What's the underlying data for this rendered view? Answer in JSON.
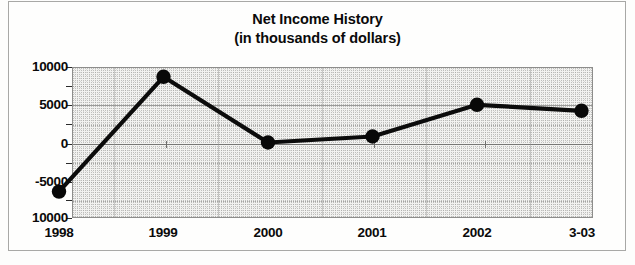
{
  "chart_data": {
    "type": "line",
    "title": "Net Income History",
    "subtitle": "(in thousands of dollars)",
    "xlabel": "",
    "ylabel": "",
    "categories": [
      "1998",
      "1999",
      "2000",
      "2001",
      "2002",
      "3-03"
    ],
    "values": [
      -6500,
      8700,
      0,
      800,
      5000,
      4200
    ],
    "series": [
      {
        "name": "Net Income",
        "values": [
          -6500,
          8700,
          0,
          800,
          5000,
          4200
        ]
      }
    ],
    "ylim": [
      -10000,
      10000
    ],
    "ytick_labels": [
      "10000",
      "5000",
      "0",
      "-5000",
      "10000"
    ],
    "ytick_values": [
      10000,
      5000,
      0,
      -5000,
      -10000
    ],
    "minor_tick_values": [
      7500,
      2500,
      -2500,
      -7500
    ],
    "grid": true,
    "legend": false,
    "legend_position": "none",
    "marker": "filled-circle",
    "line_color": "#0b0b0b",
    "plot_background": "#f2f2f0"
  },
  "title": {
    "line1": "Net Income History",
    "line2": "(in thousands of dollars)"
  },
  "axes": {
    "y": {
      "labels": [
        {
          "text": "10000",
          "value": 10000
        },
        {
          "text": "5000",
          "value": 5000
        },
        {
          "text": "0",
          "value": 0
        },
        {
          "text": "-5000",
          "value": -5000
        },
        {
          "text": "10000",
          "value": -10000
        }
      ]
    },
    "x": {
      "labels": [
        {
          "text": "1998"
        },
        {
          "text": "1999"
        },
        {
          "text": "2000"
        },
        {
          "text": "2001"
        },
        {
          "text": "2002"
        },
        {
          "text": "3-03"
        }
      ]
    }
  }
}
